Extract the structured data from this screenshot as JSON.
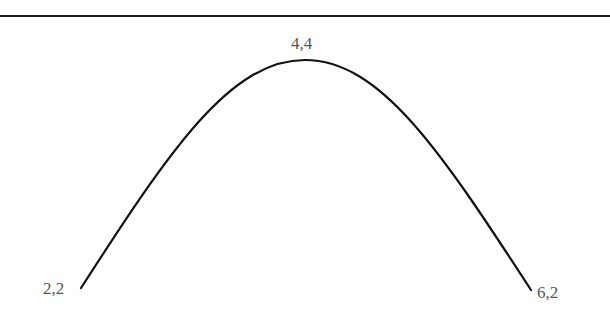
{
  "diagram": {
    "type": "curve",
    "points": [
      {
        "id": "left",
        "label": "2,2"
      },
      {
        "id": "peak",
        "label": "4,4"
      },
      {
        "id": "right",
        "label": "6,2"
      }
    ],
    "colors": {
      "curve": "#111111",
      "label": "#555555",
      "rule": "#1a1a1a",
      "background": "#ffffff"
    }
  }
}
